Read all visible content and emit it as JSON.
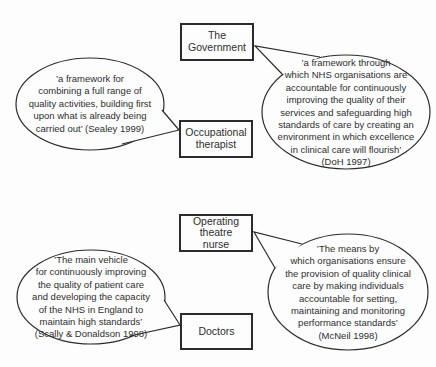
{
  "palette": {
    "bg": "#fdfdfd",
    "stroke": "#2b2b2b",
    "text": "#2e2e2e"
  },
  "boxes": {
    "government": {
      "label": "The\nGovernment"
    },
    "occupational_therapist": {
      "label": "Occupational\ntherapist"
    },
    "operating_theatre_nurse": {
      "label": "Operating\ntheatre\nnurse"
    },
    "doctors": {
      "label": "Doctors"
    }
  },
  "bubbles": {
    "sealey": {
      "text": "’a framework for\ncombining a full range of\nquality activities, building first\nupon what is already being\ncarried out’ (Sealey 1999)"
    },
    "doh": {
      "text": "’a framework through\nwhich NHS organisations are\naccountable for continuously\nimproving the quality of their\nservices and safeguarding high\nstandards of care by creating an\nenvironment in which excellence\nin clinical care will flourish’\n(DoH 1997)"
    },
    "scally": {
      "text": "’The main vehicle\nfor continuously improving\nthe quality of patient care\nand developing the capacity\nof the NHS in England to\nmaintain high standards’\n(Scally & Donaldson 1998)"
    },
    "mcneil": {
      "text": "’The means by\nwhich organisations ensure\nthe provision of quality clinical\ncare by making individuals\naccountable for setting,\nmaintaining and monitoring\nperformance standards’\n(McNeil 1998)"
    }
  }
}
